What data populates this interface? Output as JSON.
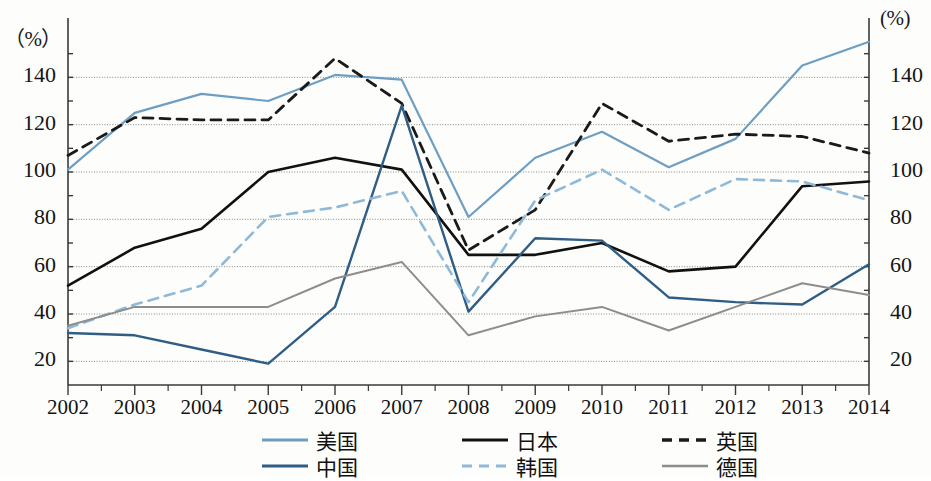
{
  "axes": {
    "unit_left": "（%）",
    "unit_right": "(%)",
    "y_ticks": [
      "140",
      "120",
      "100",
      "80",
      "60",
      "40",
      "20"
    ],
    "x_ticks": [
      "2002",
      "2003",
      "2004",
      "2005",
      "2006",
      "2007",
      "2008",
      "2009",
      "2010",
      "2011",
      "2012",
      "2013",
      "2014"
    ]
  },
  "legend": {
    "items": [
      {
        "label": "美国",
        "color": "#6d9fc4",
        "dash": "none",
        "width": 2.2
      },
      {
        "label": "日本",
        "color": "#111111",
        "dash": "none",
        "width": 2.6
      },
      {
        "label": "英国",
        "color": "#1a1a1a",
        "dash": "10,7",
        "width": 2.8
      },
      {
        "label": "中国",
        "color": "#2f5d86",
        "dash": "none",
        "width": 2.4
      },
      {
        "label": "韩国",
        "color": "#8fb9d8",
        "dash": "10,7",
        "width": 2.6
      },
      {
        "label": "德国",
        "color": "#8d8d8d",
        "dash": "none",
        "width": 2.0
      }
    ]
  },
  "chart_data": {
    "type": "line",
    "title": "",
    "xlabel": "",
    "ylabel": "(%)",
    "x": [
      2002,
      2003,
      2004,
      2005,
      2006,
      2007,
      2008,
      2009,
      2010,
      2011,
      2012,
      2013,
      2014
    ],
    "ylim": [
      10,
      160
    ],
    "yticks": [
      20,
      40,
      60,
      80,
      100,
      120,
      140
    ],
    "grid": true,
    "legend_position": "bottom",
    "dual_axis": true,
    "series": [
      {
        "name": "美国",
        "color": "#6d9fc4",
        "dash": "none",
        "values": [
          101,
          125,
          133,
          130,
          141,
          139,
          81,
          106,
          117,
          102,
          114,
          145,
          155
        ]
      },
      {
        "name": "日本",
        "color": "#111111",
        "dash": "none",
        "values": [
          52,
          68,
          76,
          100,
          106,
          101,
          65,
          65,
          70,
          58,
          60,
          94,
          96
        ]
      },
      {
        "name": "英国",
        "color": "#1a1a1a",
        "dash": "10,7",
        "values": [
          107,
          123,
          122,
          122,
          148,
          129,
          67,
          84,
          129,
          113,
          116,
          115,
          108
        ]
      },
      {
        "name": "中国",
        "color": "#2f5d86",
        "dash": "none",
        "values": [
          32,
          31,
          25,
          19,
          43,
          128,
          41,
          72,
          71,
          47,
          45,
          44,
          61
        ]
      },
      {
        "name": "韩国",
        "color": "#8fb9d8",
        "dash": "10,7",
        "values": [
          34,
          44,
          52,
          81,
          85,
          92,
          45,
          88,
          101,
          84,
          97,
          96,
          88
        ]
      },
      {
        "name": "德国",
        "color": "#8d8d8d",
        "dash": "none",
        "values": [
          35,
          43,
          43,
          43,
          55,
          62,
          31,
          39,
          43,
          33,
          43,
          53,
          48
        ]
      }
    ]
  }
}
